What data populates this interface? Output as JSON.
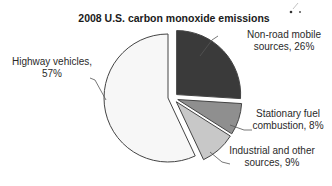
{
  "chart_data": {
    "type": "pie",
    "title": "2008 U.S. carbon monoxide emissions",
    "legend": "none",
    "slices": [
      {
        "name": "Non-road mobile sources",
        "value": 26,
        "label_lines": [
          "Non-road mobile",
          "sources, 26%"
        ],
        "color": "#3a3a3a",
        "exploded": true
      },
      {
        "name": "Stationary fuel combustion",
        "value": 8,
        "label_lines": [
          "Stationary fuel",
          "combustion, 8%"
        ],
        "color": "#8f8f8f",
        "exploded": true
      },
      {
        "name": "Industrial and other sources",
        "value": 9,
        "label_lines": [
          "Industrial and other",
          "sources, 9%"
        ],
        "color": "#c8c8c8",
        "exploded": true
      },
      {
        "name": "Highway vehicles",
        "value": 57,
        "label_lines": [
          "Highway vehicles,",
          "57%"
        ],
        "color": "#f7f7f7",
        "exploded": false
      }
    ]
  }
}
